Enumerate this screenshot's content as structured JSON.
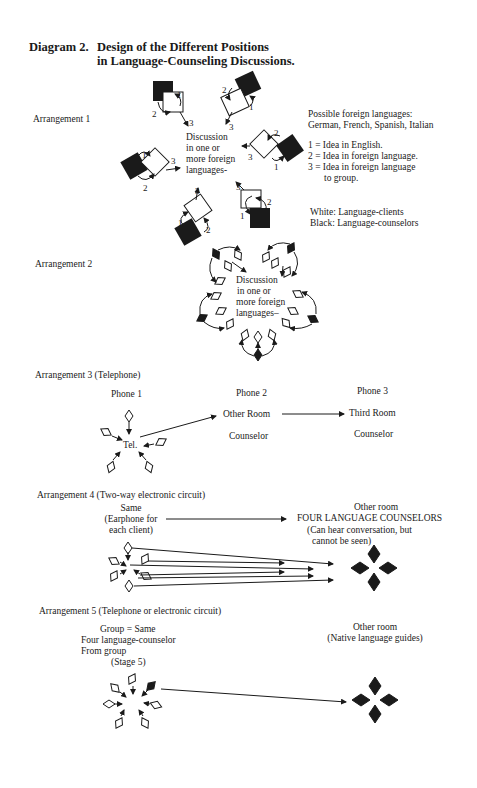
{
  "header": {
    "number": "Diagram 2.",
    "title_line1": "Design of the Different Positions",
    "title_line2": "in Language-Counseling Discussions."
  },
  "arrangement1": {
    "label": "Arrangement 1",
    "center": [
      "Discussion",
      "in one or",
      "more foreign",
      "languages-"
    ],
    "languages_heading": "Possible foreign languages:",
    "languages_list": "German, French, Spanish, Italian",
    "key": [
      "1 = Idea in English.",
      "2 = Idea in foreign language.",
      "3 = Idea in foreign language",
      "to group."
    ],
    "legend_white": "White: Language-clients",
    "legend_black": "Black: Language-counselors",
    "arrow_numbers": [
      "1",
      "2",
      "3"
    ]
  },
  "arrangement2": {
    "label": "Arrangement 2",
    "center": [
      "Discussion",
      "in one or",
      "more foreign",
      "languages–"
    ]
  },
  "arrangement3": {
    "label": "Arrangement 3  (Telephone)",
    "phone1": "Phone 1",
    "phone2": "Phone 2",
    "phone3": "Phone 3",
    "tel": "Tel.",
    "other_room": "Other Room",
    "third_room": "Third Room",
    "counselor2": "Counselor",
    "counselor3": "Counselor"
  },
  "arrangement4": {
    "label": "Arrangement 4  (Two-way electronic circuit)",
    "left": [
      "Same",
      "(Earphone for",
      "each client)"
    ],
    "right_title": "Other room",
    "right_main": "FOUR LANGUAGE COUNSELORS",
    "right_note": [
      "(Can hear conversation, but",
      "cannot be seen)"
    ]
  },
  "arrangement5": {
    "label": "Arrangement 5    (Telephone or electronic circuit)",
    "left": [
      "Group = Same",
      "Four language-counselor",
      "From group",
      "(Stage 5)"
    ],
    "right": [
      "Other room",
      "(Native language guides)"
    ]
  },
  "colors": {
    "ink": "#1a1a1a",
    "paper": "#ffffff"
  }
}
